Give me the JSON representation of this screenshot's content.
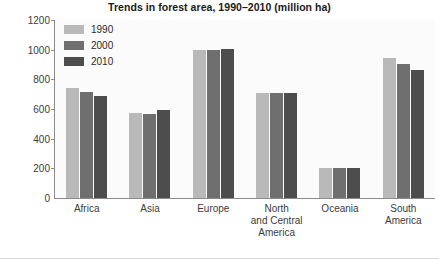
{
  "chart_data": {
    "type": "bar",
    "title": "Trends in forest area, 1990–2010 (million ha)",
    "xlabel": "",
    "ylabel": "",
    "ylim": [
      0,
      1200
    ],
    "yticks": [
      0,
      200,
      400,
      600,
      800,
      1000,
      1200
    ],
    "grid": false,
    "legend_position": "top-left-inside",
    "categories": [
      "Africa",
      "Asia",
      "Europe",
      "North and Central America",
      "Oceania",
      "South America"
    ],
    "series": [
      {
        "name": "1990",
        "color": "#b9b9b9",
        "values": [
          745,
          575,
          995,
          710,
          205,
          945
        ]
      },
      {
        "name": "2000",
        "color": "#6f6f6f",
        "values": [
          715,
          565,
          1000,
          705,
          200,
          905
        ]
      },
      {
        "name": "2010",
        "color": "#4d4d4d",
        "values": [
          690,
          590,
          1005,
          705,
          200,
          865
        ]
      }
    ]
  },
  "x_label_lines": [
    [
      "Africa"
    ],
    [
      "Asia"
    ],
    [
      "Europe"
    ],
    [
      "North",
      "and Central",
      "America"
    ],
    [
      "Oceania"
    ],
    [
      "South",
      "America"
    ]
  ]
}
